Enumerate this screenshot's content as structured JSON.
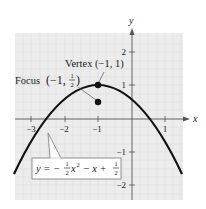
{
  "figure": {
    "type": "parabola-graph",
    "axes": {
      "x_label": "x",
      "y_label": "y",
      "x_ticks": [
        {
          "value": -3,
          "label": "−3"
        },
        {
          "value": -2,
          "label": "−2"
        },
        {
          "value": -1,
          "label": "−1"
        },
        {
          "value": 1,
          "label": "1"
        }
      ],
      "y_ticks": [
        {
          "value": 2,
          "label": "2"
        },
        {
          "value": 1,
          "label": "1"
        },
        {
          "value": -1,
          "label": "−1"
        },
        {
          "value": -2,
          "label": "−2"
        }
      ],
      "x_range": [
        -3.5,
        1.6
      ],
      "y_range": [
        -2.4,
        2.6
      ]
    },
    "curve": {
      "equation": "y = -1/2 x^2 - x + 1/2",
      "label_parts": {
        "y_eq": "y = −",
        "frac1_num": "1",
        "frac1_den": "2",
        "x_sq": "x",
        "sup": "2",
        "mid": " − x + ",
        "frac2_num": "1",
        "frac2_den": "2"
      }
    },
    "points": {
      "vertex": {
        "label": "Vertex (−1, 1)",
        "x": -1,
        "y": 1
      },
      "focus": {
        "label_prefix": "Focus",
        "label_coords": "(−1, ",
        "frac_num": "1",
        "frac_den": "2",
        "label_close": ")",
        "x": -1,
        "y": 0.5
      }
    },
    "colors": {
      "panel_bg": "#ececec",
      "grid": "#dcdcdc",
      "axis": "#555555",
      "curve": "#111111",
      "callout": "#666666"
    }
  }
}
